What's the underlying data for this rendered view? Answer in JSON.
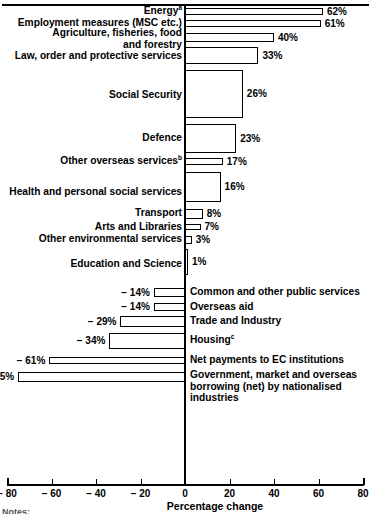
{
  "chart_data": {
    "type": "bar",
    "orientation": "horizontal",
    "title": "",
    "xlabel": "Percentage change",
    "ylabel": "",
    "xlim": [
      -80,
      80
    ],
    "xticks": [
      -80,
      -60,
      -40,
      -20,
      0,
      20,
      40,
      60,
      80
    ],
    "xticklabels": [
      "− 80",
      "− 60",
      "− 40",
      "− 20",
      "0",
      "20",
      "40",
      "60",
      "80"
    ],
    "grid": false,
    "legend": null,
    "categories": [
      "Energy",
      "Employment measures (MSC etc.)",
      "Agriculture, fisheries, food and forestry",
      "Law, order and protective services",
      "Social Security",
      "Defence",
      "Other overseas services",
      "Health and personal social services",
      "Transport",
      "Arts and Libraries",
      "Other environmental services",
      "Education and Science",
      "Common and other public services",
      "Overseas aid",
      "Trade and Industry",
      "Housing",
      "Net payments to EC institutions",
      "Government, market and overseas borrowing (net) by nationalised industries"
    ],
    "values": [
      62,
      61,
      40,
      33,
      26,
      23,
      17,
      16,
      8,
      7,
      3,
      1,
      -14,
      -14,
      -29,
      -34,
      -61,
      -75
    ],
    "value_labels": [
      "62%",
      "61%",
      "40%",
      "33%",
      "26%",
      "23%",
      "17%",
      "16%",
      "8%",
      "7%",
      "3%",
      "1%",
      "− 14%",
      "− 14%",
      "− 29%",
      "− 34%",
      "− 61%",
      "− 75%"
    ],
    "footnote_markers": {
      "Energy": "a",
      "Other overseas services": "b",
      "Housing": "c"
    }
  },
  "axis": {
    "title": "Percentage change",
    "ticklabels": [
      "− 80",
      "− 60",
      "− 40",
      "− 20",
      "0",
      "20",
      "40",
      "60",
      "80"
    ]
  },
  "rows": [
    {
      "label": "Energy",
      "sup": "a",
      "value_label": "62%",
      "side": "left"
    },
    {
      "label": "Employment measures (MSC etc.)",
      "sup": "",
      "value_label": "61%",
      "side": "left"
    },
    {
      "label": "Agriculture, fisheries, food\nand forestry",
      "sup": "",
      "value_label": "40%",
      "side": "left"
    },
    {
      "label": "Law, order and protective services",
      "sup": "",
      "value_label": "33%",
      "side": "left"
    },
    {
      "label": "Social Security",
      "sup": "",
      "value_label": "26%",
      "side": "left"
    },
    {
      "label": "Defence",
      "sup": "",
      "value_label": "23%",
      "side": "left"
    },
    {
      "label": "Other overseas services",
      "sup": "b",
      "value_label": "17%",
      "side": "left"
    },
    {
      "label": "Health and personal social services",
      "sup": "",
      "value_label": "16%",
      "side": "left"
    },
    {
      "label": "Transport",
      "sup": "",
      "value_label": "8%",
      "side": "left"
    },
    {
      "label": "Arts and Libraries",
      "sup": "",
      "value_label": "7%",
      "side": "left"
    },
    {
      "label": "Other environmental services",
      "sup": "",
      "value_label": "3%",
      "side": "left"
    },
    {
      "label": "Education and Science",
      "sup": "",
      "value_label": "1%",
      "side": "left"
    },
    {
      "label": "Common and other public services",
      "sup": "",
      "value_label": "− 14%",
      "side": "right"
    },
    {
      "label": "Overseas aid",
      "sup": "",
      "value_label": "− 14%",
      "side": "right"
    },
    {
      "label": "Trade and Industry",
      "sup": "",
      "value_label": "− 29%",
      "side": "right"
    },
    {
      "label": "Housing",
      "sup": "c",
      "value_label": "− 34%",
      "side": "right"
    },
    {
      "label": "Net payments to EC institutions",
      "sup": "",
      "value_label": "− 61%",
      "side": "right"
    },
    {
      "label": "Government, market and overseas\nborrowing (net) by nationalised\nindustries",
      "sup": "",
      "value_label": "− 75%",
      "side": "right"
    }
  ],
  "notes": {
    "label": "Notes:"
  }
}
